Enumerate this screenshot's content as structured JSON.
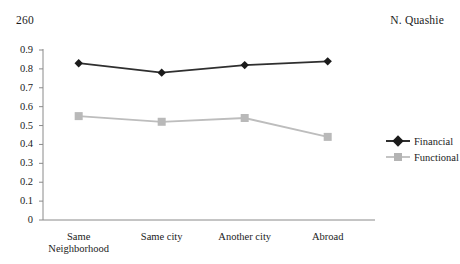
{
  "page": {
    "number": "260",
    "running_head": "N. Quashie"
  },
  "chart_data": {
    "type": "line",
    "title": "",
    "xlabel": "",
    "ylabel": "",
    "categories": [
      "Same Neighborhood",
      "Same city",
      "Another city",
      "Abroad"
    ],
    "category_lines": [
      [
        "Same",
        "Neighborhood"
      ],
      [
        "Same city"
      ],
      [
        "Another city"
      ],
      [
        "Abroad"
      ]
    ],
    "series": [
      {
        "name": "Financial",
        "values": [
          0.83,
          0.78,
          0.82,
          0.84
        ],
        "color": "#2f2f2f",
        "marker": "diamond"
      },
      {
        "name": "Functional",
        "values": [
          0.55,
          0.52,
          0.54,
          0.44
        ],
        "color": "#bdbdbd",
        "marker": "square"
      }
    ],
    "ylim": [
      0,
      0.9
    ],
    "yticks": [
      0,
      0.1,
      0.2,
      0.3,
      0.4,
      0.5,
      0.6,
      0.7,
      0.8,
      0.9
    ],
    "ytick_labels": [
      "0",
      "0.1",
      "0.2",
      "0.3",
      "0.4",
      "0.5",
      "0.6",
      "0.7",
      "0.8",
      "0.9"
    ],
    "grid": false,
    "legend_position": "right",
    "axis_color": "#8a8a8a"
  }
}
